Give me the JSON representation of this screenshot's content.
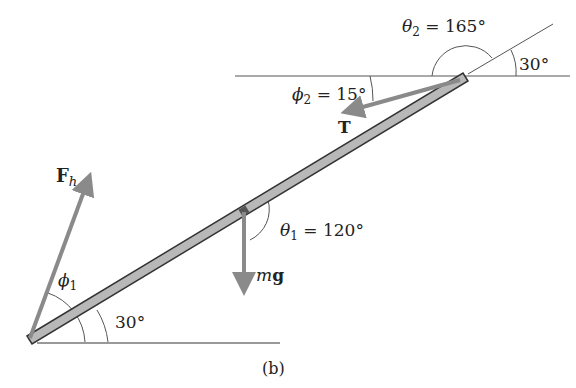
{
  "figure": {
    "caption": "(b)",
    "beam_angle_label": "30°",
    "top_angle_label": "30°"
  },
  "forces": {
    "hinge": {
      "symbol": "F",
      "subscript": "h",
      "angle_label_symbol": "ϕ",
      "angle_label_sub": "1"
    },
    "weight": {
      "symbol_italic": "m",
      "symbol_bold": "g",
      "angle_label_symbol": "θ",
      "angle_label_sub": "1",
      "angle_value": " = 120°"
    },
    "tension": {
      "symbol": "T",
      "phi_symbol": "ϕ",
      "phi_sub": "2",
      "phi_value": " = 15°",
      "theta_symbol": "θ",
      "theta_sub": "2",
      "theta_value": " = 165°"
    }
  },
  "colors": {
    "beam_fill": "#b8b8b8",
    "beam_stroke": "#333333",
    "arrow": "#8a8a8a",
    "line": "#555555"
  }
}
